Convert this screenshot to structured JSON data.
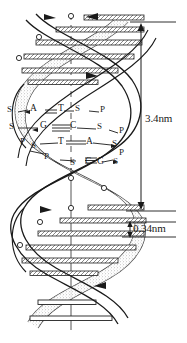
{
  "figure": {
    "name": "dna-double-helix-diagram",
    "type": "line-drawing",
    "background_color": "#ffffff",
    "ink_color": "#1a1a1a",
    "shade_color": "#9a9a9a"
  },
  "dimensions": {
    "pitch": {
      "label": "3.4nm",
      "name": "helix-pitch-measurement"
    },
    "rise": {
      "label": "0.34nm",
      "name": "base-pair-rise-measurement"
    }
  },
  "base_pairs": [
    {
      "left_backbone": [
        "S"
      ],
      "left_base": "A",
      "bond": "=",
      "right_base": "T",
      "right_backbone": [
        "S",
        "P"
      ]
    },
    {
      "left_backbone": [
        "S"
      ],
      "left_base": "G",
      "bond": "≡",
      "right_base": "C",
      "right_backbone": [
        "S",
        "P"
      ]
    },
    {
      "left_backbone": [
        "P",
        "S"
      ],
      "left_base": "T",
      "bond": "=",
      "right_base": "A",
      "right_backbone": [
        "S",
        "P"
      ]
    },
    {
      "left_backbone": [
        "P",
        "S"
      ],
      "left_base": "C",
      "bond": "≡",
      "right_base": "G",
      "right_backbone": [
        "S"
      ]
    }
  ],
  "glyphs": {
    "sugar": "S",
    "phosphate": "P",
    "adenine": "A",
    "thymine": "T",
    "guanine": "G",
    "cytosine": "C",
    "double_bond": "=",
    "triple_bond": "≡",
    "dash": "—"
  },
  "rows": [
    {
      "l1": "S",
      "b1": "A",
      "bond": "=",
      "b2": "T",
      "r1": "S",
      "r2": "P"
    },
    {
      "l1": "S",
      "b1": "G",
      "bond": "≡",
      "b2": "C",
      "r1": "S",
      "r2": "P"
    },
    {
      "l0": "P",
      "l1": "S",
      "b1": "T",
      "bond": "=",
      "b2": "A",
      "r1": "S",
      "r2": "P"
    },
    {
      "l0": "P",
      "l1": "S",
      "b1": "C",
      "bond": "≡",
      "b2": "G",
      "r1": "S"
    }
  ]
}
